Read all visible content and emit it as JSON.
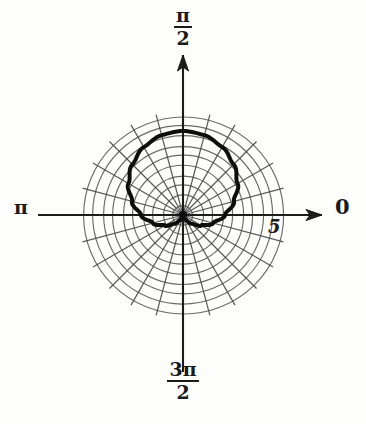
{
  "figure": {
    "type": "polar-plot",
    "background_color": "#fdfdfc",
    "ink_color": "#1a1a1a",
    "grid_color": "#4a4a4a"
  },
  "labels": {
    "angle_zero": "0",
    "angle_pi_over_two_numerator": "π",
    "angle_pi_over_two_denominator": "2",
    "angle_pi": "π",
    "angle_three_pi_over_two_numerator": "3π",
    "angle_three_pi_over_two_denominator": "2",
    "radius_tick": "5"
  },
  "chart_data": {
    "type": "line",
    "subtype": "polar",
    "title": "",
    "xlabel": "",
    "ylabel": "",
    "coordinate_system": "polar",
    "center_px": [
      183,
      215
    ],
    "outer_radius_px": 100,
    "grid": {
      "enabled": true,
      "radial_circle_count": 10,
      "radial_circle_values": [
        0.5,
        1,
        1.5,
        2,
        2.5,
        3,
        3.5,
        4,
        4.5,
        5
      ],
      "radial_tick_labeled": 5,
      "angular_spoke_count": 24,
      "angular_spoke_step_deg": 15,
      "r_max": 5
    },
    "axes": {
      "angle_labels_deg": [
        0,
        90,
        180,
        270
      ],
      "angle_label_text": [
        "0",
        "π/2",
        "π",
        "3π/2"
      ],
      "arrowheads_at_deg": [
        0,
        90
      ]
    },
    "legend": {
      "visible": false,
      "position": "none"
    },
    "series": [
      {
        "name": "cardioid",
        "equation": "r = 2.1(1 + sin θ)",
        "color": "#111111",
        "line_width_px": 4,
        "closed": true,
        "passes_through_pole": true,
        "pole_angle_deg": 270,
        "theta_deg": [
          0,
          15,
          30,
          45,
          60,
          75,
          90,
          105,
          120,
          135,
          150,
          165,
          180,
          195,
          210,
          225,
          240,
          255,
          270,
          285,
          300,
          315,
          330,
          345,
          360
        ],
        "r": [
          2.1,
          2.64,
          3.15,
          3.58,
          3.92,
          4.13,
          4.2,
          4.13,
          3.92,
          3.58,
          3.15,
          2.64,
          2.1,
          1.56,
          1.05,
          0.62,
          0.28,
          0.07,
          0.0,
          0.07,
          0.28,
          0.62,
          1.05,
          1.56,
          2.1
        ]
      }
    ]
  }
}
